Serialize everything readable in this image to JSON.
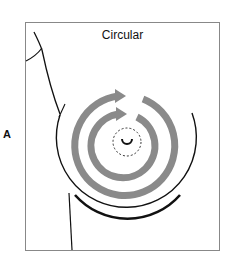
{
  "figure": {
    "panel_label": "A",
    "title": "Circular",
    "colors": {
      "outline": "#111111",
      "arrows": "#8a8a8a",
      "frame": "#888888"
    },
    "rings": [
      {
        "name": "outer-ring",
        "direction": "clockwise"
      },
      {
        "name": "inner-ring",
        "direction": "clockwise"
      }
    ]
  }
}
